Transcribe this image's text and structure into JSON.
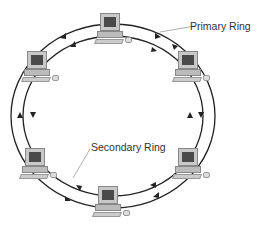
{
  "diagram": {
    "labels": {
      "primary": "Primary Ring",
      "secondary": "Secondary Ring"
    },
    "nodes": [
      {
        "id": "pc-top",
        "x": 100,
        "y": 13
      },
      {
        "id": "pc-top-right",
        "x": 176,
        "y": 51
      },
      {
        "id": "pc-bottom-right",
        "x": 176,
        "y": 148
      },
      {
        "id": "pc-bottom",
        "x": 98,
        "y": 186
      },
      {
        "id": "pc-bottom-left",
        "x": 22,
        "y": 148
      },
      {
        "id": "pc-top-left",
        "x": 22,
        "y": 51
      }
    ],
    "colors": {
      "ring": "#222222",
      "leader": "#999999"
    }
  }
}
